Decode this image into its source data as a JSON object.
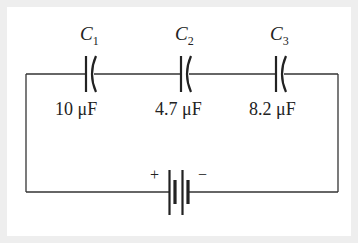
{
  "diagram": {
    "type": "circuit",
    "capacitors": [
      {
        "name": "C",
        "sub": "1",
        "value": "10 μF"
      },
      {
        "name": "C",
        "sub": "2",
        "value": "4.7 μF"
      },
      {
        "name": "C",
        "sub": "3",
        "value": "8.2 μF"
      }
    ],
    "battery": {
      "plus": "+",
      "minus": "−"
    },
    "colors": {
      "wire": "#333333",
      "background": "#eeeeee",
      "panel": "#ffffff"
    }
  }
}
